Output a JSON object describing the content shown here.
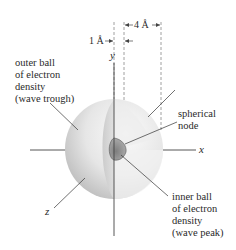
{
  "diagram": {
    "title": "",
    "axes": {
      "x_label": "x",
      "y_label": "y",
      "z_label": "z"
    },
    "dimensions": {
      "inner_radius": "1 Å",
      "outer_radius": "4 Å"
    },
    "labels": {
      "outer_ball": [
        "outer ball",
        "of electron",
        "density",
        "(wave trough)"
      ],
      "spherical_node": [
        "spherical",
        "node"
      ],
      "inner_ball": [
        "inner ball",
        "of electron",
        "density",
        "(wave peak)"
      ]
    },
    "colors": {
      "sphere_light": "#f2f2f2",
      "sphere_mid": "#cfcfcf",
      "sphere_dark": "#a9a9a9",
      "inner_ball": "#9a9a9a",
      "line": "#333333",
      "dashed": "#888888"
    }
  }
}
